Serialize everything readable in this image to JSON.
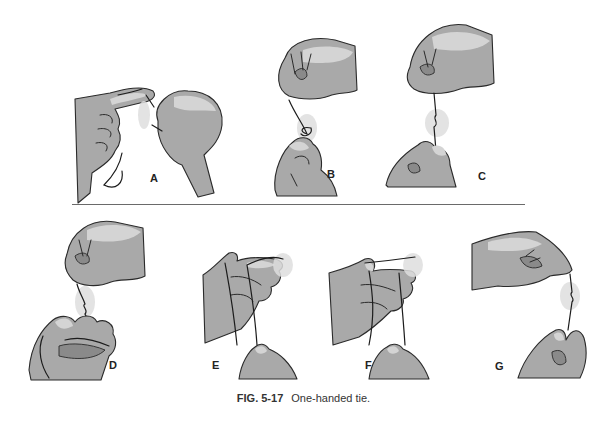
{
  "figure": {
    "panels": [
      {
        "id": "A",
        "label": "A"
      },
      {
        "id": "B",
        "label": "B"
      },
      {
        "id": "C",
        "label": "C"
      },
      {
        "id": "D",
        "label": "D"
      },
      {
        "id": "E",
        "label": "E"
      },
      {
        "id": "F",
        "label": "F"
      },
      {
        "id": "G",
        "label": "G"
      }
    ],
    "caption": {
      "number": "FIG. 5-17",
      "text": "One-handed tie."
    },
    "colors": {
      "hand_fill": "#a9a9a9",
      "hand_highlight": "#d4d4d4",
      "outline": "#2a2a2a",
      "divider": "#6a6a6a"
    }
  }
}
